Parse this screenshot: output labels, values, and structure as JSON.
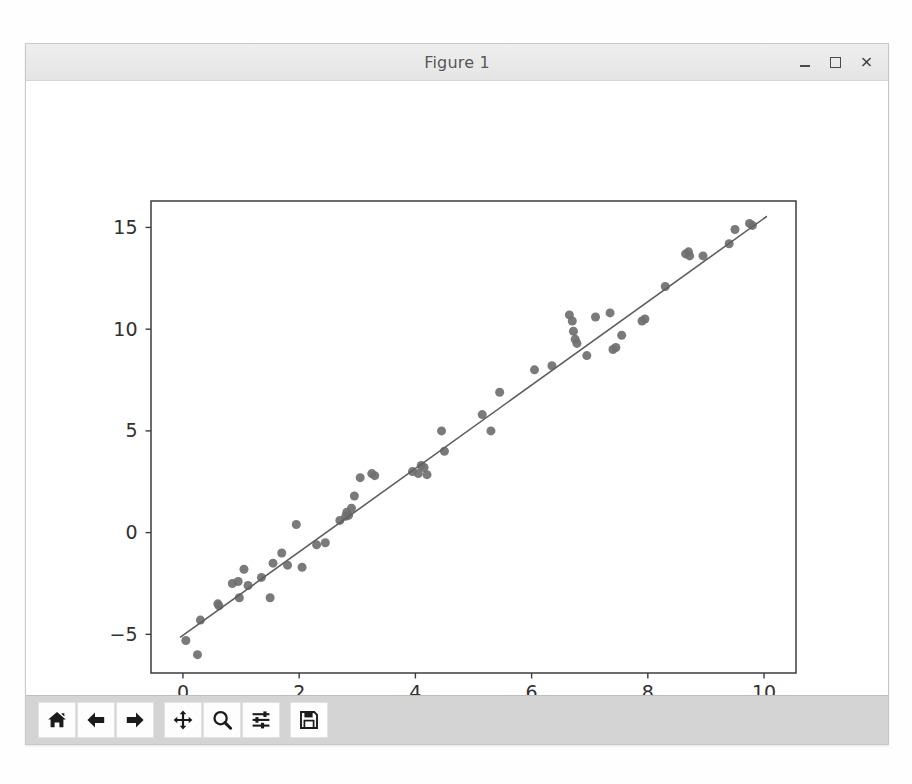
{
  "window": {
    "title": "Figure 1",
    "controls": {
      "minimize": "minimize-button",
      "maximize": "maximize-button",
      "close": "×"
    }
  },
  "toolbar": {
    "buttons": [
      {
        "name": "home-button",
        "label": "Home",
        "icon": "home-icon"
      },
      {
        "name": "back-button",
        "label": "Back",
        "icon": "arrow-left-icon"
      },
      {
        "name": "forward-button",
        "label": "Forward",
        "icon": "arrow-right-icon"
      },
      {
        "name": "pan-button",
        "label": "Pan",
        "icon": "move-cross-icon"
      },
      {
        "name": "zoom-button",
        "label": "Zoom to rectangle",
        "icon": "magnifier-icon"
      },
      {
        "name": "configure-subplots-button",
        "label": "Configure subplots",
        "icon": "sliders-icon"
      },
      {
        "name": "save-button",
        "label": "Save the figure",
        "icon": "floppy-disk-icon"
      }
    ]
  },
  "colors": {
    "marker": "#6f6f6f",
    "line": "#5e5e5e",
    "axes_spine": "#3c3c3c",
    "tick_label": "#303030",
    "figure_background": "#ffffff",
    "titlebar": "#e9e9e9",
    "toolbar": "#d4d4d4"
  },
  "chart_data": {
    "type": "scatter",
    "title": "",
    "xlabel": "",
    "ylabel": "",
    "xlim": [
      -0.55,
      10.55
    ],
    "ylim": [
      -6.9,
      16.3
    ],
    "xticks": [
      0,
      2,
      4,
      6,
      8,
      10
    ],
    "yticks": [
      -5,
      0,
      5,
      10,
      15
    ],
    "xticklabels": [
      "0",
      "2",
      "4",
      "6",
      "8",
      "10"
    ],
    "yticklabels": [
      "−5",
      "0",
      "5",
      "10",
      "15"
    ],
    "grid": false,
    "legend": null,
    "series": [
      {
        "name": "observations",
        "type": "scatter",
        "marker": "circle",
        "color": "#6f6f6f",
        "size": 9,
        "points": [
          [
            0.05,
            -5.3
          ],
          [
            0.25,
            -6.0
          ],
          [
            0.3,
            -4.3
          ],
          [
            0.6,
            -3.5
          ],
          [
            0.62,
            -3.6
          ],
          [
            0.85,
            -2.5
          ],
          [
            0.95,
            -2.4
          ],
          [
            0.97,
            -3.2
          ],
          [
            1.05,
            -1.8
          ],
          [
            1.12,
            -2.6
          ],
          [
            1.35,
            -2.2
          ],
          [
            1.5,
            -3.2
          ],
          [
            1.55,
            -1.5
          ],
          [
            1.7,
            -1.0
          ],
          [
            1.8,
            -1.6
          ],
          [
            1.95,
            0.4
          ],
          [
            2.05,
            -1.7
          ],
          [
            2.3,
            -0.6
          ],
          [
            2.45,
            -0.5
          ],
          [
            2.7,
            0.6
          ],
          [
            2.8,
            0.8
          ],
          [
            2.82,
            1.0
          ],
          [
            2.85,
            0.85
          ],
          [
            2.9,
            1.2
          ],
          [
            2.95,
            1.8
          ],
          [
            3.05,
            2.7
          ],
          [
            3.25,
            2.9
          ],
          [
            3.3,
            2.8
          ],
          [
            3.95,
            3.0
          ],
          [
            4.05,
            2.9
          ],
          [
            4.1,
            3.3
          ],
          [
            4.15,
            3.2
          ],
          [
            4.2,
            2.85
          ],
          [
            4.45,
            5.0
          ],
          [
            4.5,
            4.0
          ],
          [
            5.15,
            5.8
          ],
          [
            5.3,
            5.0
          ],
          [
            5.45,
            6.9
          ],
          [
            6.05,
            8.0
          ],
          [
            6.35,
            8.2
          ],
          [
            6.65,
            10.7
          ],
          [
            6.7,
            10.4
          ],
          [
            6.72,
            9.9
          ],
          [
            6.75,
            9.5
          ],
          [
            6.78,
            9.3
          ],
          [
            6.95,
            8.7
          ],
          [
            7.1,
            10.6
          ],
          [
            7.35,
            10.8
          ],
          [
            7.4,
            9.0
          ],
          [
            7.45,
            9.1
          ],
          [
            7.55,
            9.7
          ],
          [
            7.9,
            10.4
          ],
          [
            7.95,
            10.5
          ],
          [
            8.3,
            12.1
          ],
          [
            8.65,
            13.7
          ],
          [
            8.7,
            13.8
          ],
          [
            8.72,
            13.6
          ],
          [
            8.95,
            13.6
          ],
          [
            9.4,
            14.2
          ],
          [
            9.5,
            14.9
          ],
          [
            9.75,
            15.2
          ],
          [
            9.8,
            15.1
          ]
        ]
      },
      {
        "name": "fit-line",
        "type": "line",
        "color": "#5e5e5e",
        "width": 1.6,
        "endpoints": [
          [
            -0.05,
            -5.15
          ],
          [
            10.05,
            15.55
          ]
        ],
        "slope": 2.05,
        "intercept": -5.05
      }
    ]
  }
}
